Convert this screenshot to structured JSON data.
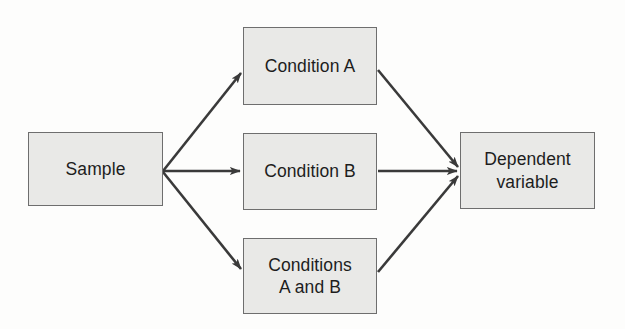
{
  "diagram": {
    "background_color": "#fdfdfc",
    "node_fill_color": "#e9e9e7",
    "node_border_color": "#6e6e6e",
    "text_color": "#1d1d1d",
    "arrow_color": "#3a3a3a",
    "nodes": [
      {
        "id": "sample",
        "label": "Sample"
      },
      {
        "id": "condition_a",
        "label": "Condition A"
      },
      {
        "id": "condition_b",
        "label": "Condition B"
      },
      {
        "id": "conditions_ab",
        "label": "Conditions\nA and B"
      },
      {
        "id": "dependent_variable",
        "label": "Dependent\nvariable"
      }
    ],
    "edges": [
      {
        "id": "sample-to-condition-a",
        "from": "Sample",
        "to": "Condition A"
      },
      {
        "id": "sample-to-condition-b",
        "from": "Sample",
        "to": "Condition B"
      },
      {
        "id": "sample-to-conditions-ab",
        "from": "Sample",
        "to": "Conditions A and B"
      },
      {
        "id": "condition-a-to-dependent-variable",
        "from": "Condition A",
        "to": "Dependent variable"
      },
      {
        "id": "condition-b-to-dependent-variable",
        "from": "Condition B",
        "to": "Dependent variable"
      },
      {
        "id": "conditions-ab-to-dependent-variable",
        "from": "Conditions A and B",
        "to": "Dependent variable"
      }
    ]
  }
}
